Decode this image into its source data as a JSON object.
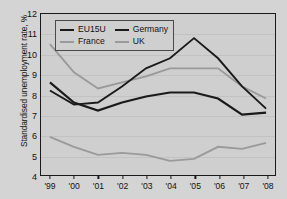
{
  "chart_data": {
    "type": "line",
    "title": "",
    "xlabel": "",
    "ylabel": "Standardised unemployment rate, %",
    "categories": [
      "'99",
      "'00",
      "'01",
      "'02",
      "'03",
      "'04",
      "'05",
      "'06",
      "'07",
      "'08"
    ],
    "ylim": [
      4,
      12
    ],
    "yticks": [
      4,
      5,
      6,
      7,
      8,
      9,
      10,
      11,
      12
    ],
    "grid": true,
    "legend_position": "top-left",
    "series": [
      {
        "name": "EU15U",
        "color": "#1a1a1a",
        "width": 2.2,
        "values": [
          8.6,
          7.6,
          7.2,
          7.6,
          7.9,
          8.1,
          8.1,
          7.8,
          7.0,
          7.1
        ]
      },
      {
        "name": "Germany",
        "color": "#1a1a1a",
        "width": 1.9,
        "values": [
          8.2,
          7.5,
          7.6,
          8.4,
          9.3,
          9.8,
          10.8,
          9.8,
          8.4,
          7.3
        ]
      },
      {
        "name": "France",
        "color": "#9a9a9a",
        "width": 1.9,
        "values": [
          10.5,
          9.1,
          8.3,
          8.6,
          8.9,
          9.3,
          9.3,
          9.3,
          8.4,
          7.8
        ]
      },
      {
        "name": "UK",
        "color": "#9a9a9a",
        "width": 1.9,
        "values": [
          5.9,
          5.4,
          5.0,
          5.1,
          5.0,
          4.7,
          4.8,
          5.4,
          5.3,
          5.6
        ]
      }
    ]
  },
  "legend": {
    "items": [
      {
        "label": "EU15U",
        "color": "#1a1a1a",
        "width": 2.4
      },
      {
        "label": "Germany",
        "color": "#1a1a1a",
        "width": 2.0
      },
      {
        "label": "France",
        "color": "#9a9a9a",
        "width": 2.0
      },
      {
        "label": "UK",
        "color": "#9a9a9a",
        "width": 2.0
      }
    ]
  }
}
